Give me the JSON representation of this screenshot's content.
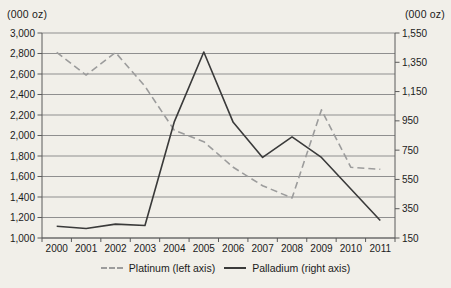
{
  "chart_data": {
    "type": "line",
    "title": "",
    "categories": [
      "2000",
      "2001",
      "2002",
      "2003",
      "2004",
      "2005",
      "2006",
      "2007",
      "2008",
      "2009",
      "2010",
      "2011"
    ],
    "series": [
      {
        "name": "Platinum (left axis)",
        "axis": "left",
        "style": "dashed",
        "color": "#9c9c9c",
        "values": [
          2810,
          2590,
          2810,
          2480,
          2050,
          1940,
          1690,
          1510,
          1390,
          2250,
          1690,
          1670
        ]
      },
      {
        "name": "Palladium (right axis)",
        "axis": "right",
        "style": "solid",
        "color": "#3a3a3a",
        "values": [
          230,
          215,
          245,
          235,
          945,
          1420,
          940,
          700,
          840,
          700,
          485,
          270
        ]
      }
    ],
    "left_axis": {
      "title": "(000 oz)",
      "min": 1000,
      "max": 3000,
      "step": 200,
      "tick_labels": [
        "3,000",
        "2,800",
        "2,600",
        "2,400",
        "2,200",
        "2,000",
        "1,800",
        "1,600",
        "1,400",
        "1,200",
        "1,000"
      ]
    },
    "right_axis": {
      "title": "(000 oz)",
      "min": 150,
      "max": 1550,
      "step": 200,
      "tick_labels": [
        "1,550",
        "1,350",
        "1,150",
        "950",
        "750",
        "550",
        "350",
        "150"
      ]
    },
    "grid": true,
    "legend_position": "bottom",
    "colors": {
      "gridline": "#8f8f8f",
      "axis": "#5a5a5a",
      "text": "#1b1b1b",
      "background": "#f1efe9"
    }
  }
}
